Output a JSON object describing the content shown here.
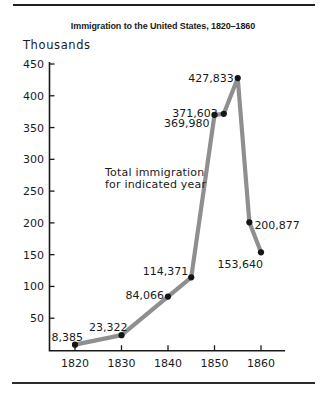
{
  "chart_data": {
    "type": "line",
    "title": "Immigration to the United States, 1820–1860",
    "ylabel": "Thousands",
    "xlabel": "",
    "annotation_lines": [
      "Total immigration",
      "for indicated year"
    ],
    "x_ticks": [
      "1820",
      "1830",
      "1840",
      "1850",
      "1860"
    ],
    "y_ticks": [
      50,
      100,
      150,
      200,
      250,
      300,
      350,
      400,
      450
    ],
    "ylim": [
      0,
      460
    ],
    "xlim": [
      1814,
      1865
    ],
    "grid": false,
    "legend": "none",
    "line_color": "#8f8f8f",
    "point_color": "#151515",
    "axis_color": "#1a1a1a",
    "points": [
      {
        "year": 1820,
        "value": 8385,
        "label": "8,385",
        "anchor": "end",
        "dx": 8,
        "dy": -4
      },
      {
        "year": 1830,
        "value": 23322,
        "label": "23,322",
        "anchor": "end",
        "dx": 6,
        "dy": -4
      },
      {
        "year": 1840,
        "value": 84066,
        "label": "84,066",
        "anchor": "end",
        "dx": -4,
        "dy": 2
      },
      {
        "year": 1845,
        "value": 114371,
        "label": "114,371",
        "anchor": "end",
        "dx": -3,
        "dy": -2
      },
      {
        "year": 1850,
        "value": 369980,
        "label": "369,980",
        "anchor": "end",
        "dx": -5,
        "dy": 12
      },
      {
        "year": 1852,
        "value": 371603,
        "label": "371,603",
        "anchor": "end",
        "dx": -6,
        "dy": 3
      },
      {
        "year": 1855,
        "value": 427833,
        "label": "427,833",
        "anchor": "end",
        "dx": -4,
        "dy": 4
      },
      {
        "year": 1857.5,
        "value": 200877,
        "label": "200,877",
        "anchor": "start",
        "dx": 5,
        "dy": 7
      },
      {
        "year": 1860,
        "value": 153640,
        "label": "153,640",
        "anchor": "end",
        "dx": 2,
        "dy": 16
      }
    ]
  }
}
